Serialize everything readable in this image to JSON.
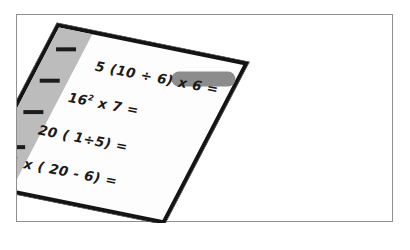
{
  "scene": {
    "description": "worksheet-paper-illustration",
    "background_color": "#ffffff",
    "frame_color": "#8f8f8f"
  },
  "paper": {
    "name": "math worksheet sheet",
    "paper_color": "#fdfdfd",
    "border_color": "#141414",
    "margin_strip_color": "#bcbcbc",
    "smudge_color": "#8c8c8c",
    "tick_marks": [
      {
        "label": "tick-1"
      },
      {
        "label": "tick-2"
      },
      {
        "label": "tick-3"
      },
      {
        "label": "tick-4"
      }
    ],
    "equations": [
      {
        "text": "5 (10 ÷ 6) x 6 =",
        "base": "5 (10 ÷ 6) x 6 =",
        "superscript": ""
      },
      {
        "text": "16² x 7 =",
        "base": "16",
        "superscript": "2",
        "tail": " x 7 ="
      },
      {
        "text": "20 ( 1÷5) =",
        "base": "20 ( 1÷5) =",
        "superscript": ""
      },
      {
        "text": "1 x ( 20 - 6) =",
        "base": "1 x ( 20 - 6) =",
        "superscript": ""
      }
    ]
  }
}
